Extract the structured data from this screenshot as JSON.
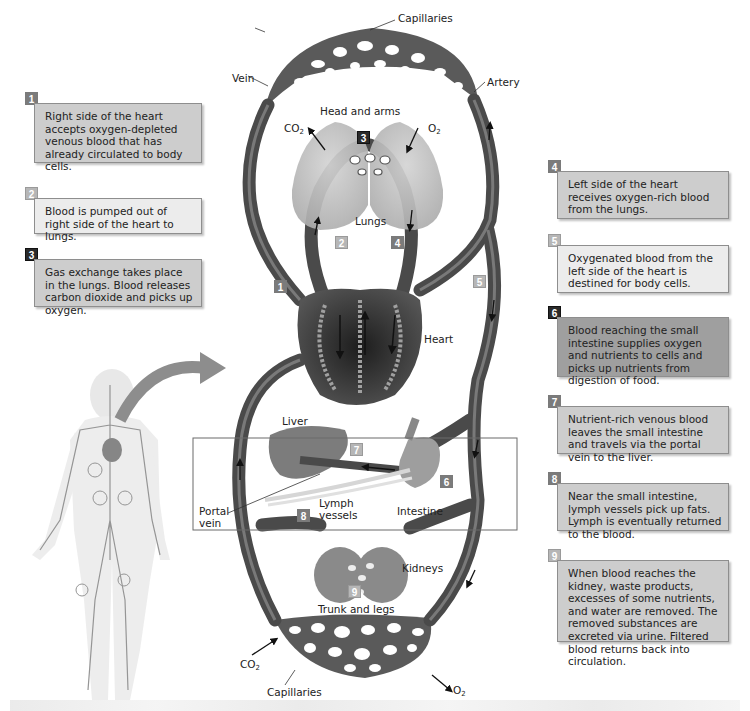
{
  "figure": {
    "diagram_labels": {
      "capillaries_top": "Capillaries",
      "vein": "Vein",
      "artery": "Artery",
      "head_and_arms": "Head and arms",
      "co2_top": "CO",
      "co2_top_sub": "2",
      "o2_top": "O",
      "o2_top_sub": "2",
      "lungs": "Lungs",
      "heart": "Heart",
      "liver": "Liver",
      "portal_vein_line1": "Portal",
      "portal_vein_line2": "vein",
      "lymph_vessels_line1": "Lymph",
      "lymph_vessels_line2": "vessels",
      "intestine": "Intestine",
      "kidneys": "Kidneys",
      "trunk_and_legs": "Trunk and legs",
      "co2_bottom": "CO",
      "co2_bottom_sub": "2",
      "o2_bottom": "O",
      "o2_bottom_sub": "2",
      "capillaries_bottom": "Capillaries"
    },
    "diagram_badges": [
      "1",
      "2",
      "3",
      "4",
      "5",
      "6",
      "7",
      "8",
      "9"
    ],
    "steps": [
      {
        "number": "1",
        "text": "Right side of the heart accepts oxygen-depleted venous blood that has already circulated to body cells."
      },
      {
        "number": "2",
        "text": "Blood is pumped out of right side of the heart to lungs."
      },
      {
        "number": "3",
        "text": "Gas exchange takes place in the lungs. Blood releases carbon dioxide and picks up oxygen."
      },
      {
        "number": "4",
        "text": "Left side of the heart receives oxygen-rich blood from the lungs."
      },
      {
        "number": "5",
        "text": "Oxygenated blood from the left side of the heart is destined for body cells."
      },
      {
        "number": "6",
        "text": "Blood reaching the small intestine supplies oxygen and nutrients to cells and picks up nutrients from digestion of food."
      },
      {
        "number": "7",
        "text": "Nutrient-rich venous blood leaves the small intestine and travels via the portal vein to the liver."
      },
      {
        "number": "8",
        "text": "Near the small intestine, lymph vessels pick up fats. Lymph is eventually returned to the blood."
      },
      {
        "number": "9",
        "text": "When blood reaches the kidney, waste products, excesses of some nutrients, and water are removed. The removed substances are excreted via urine. Filtered blood returns back into circulation."
      }
    ],
    "colors": {
      "vessel": "#4a4a4a",
      "vessel_highlight": "#8a8a8a",
      "organ": "#9a9a9a",
      "organ_light": "#c4c4c4",
      "note_light": "#ececec",
      "note_mid": "#cdcdcd",
      "note_dark": "#9f9f9f"
    }
  }
}
